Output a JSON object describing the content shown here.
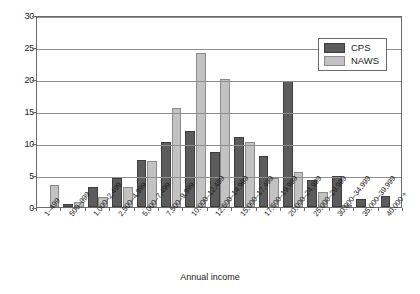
{
  "chart_data": {
    "type": "bar",
    "title": "",
    "xlabel": "Annual income",
    "ylabel": "",
    "ylim": [
      0,
      30
    ],
    "yticks": [
      0,
      5,
      10,
      15,
      20,
      25,
      30
    ],
    "grid": true,
    "legend_position": "top-right",
    "categories": [
      "1–499",
      "500–999",
      "1,000–2,499",
      "2,500–4,999",
      "5,000–7,499",
      "7,500–9,999",
      "10,000–12,499",
      "12,500–14,999",
      "15,000–17,499",
      "17,500–19,999",
      "20,000–24,999",
      "25,000–29,999",
      "30,000–34,999",
      "35,000–39,999",
      "40,000 +"
    ],
    "series": [
      {
        "name": "CPS",
        "color": "#5c5c5c",
        "values": [
          0,
          0.5,
          3.2,
          4.6,
          7.3,
          10.2,
          11.9,
          8.6,
          11.0,
          8.0,
          19.7,
          4.2,
          4.8,
          1.3,
          1.7
        ]
      },
      {
        "name": "NAWS",
        "color": "#c2c2c2",
        "values": [
          3.4,
          0.8,
          1.6,
          3.1,
          7.2,
          15.5,
          24.0,
          20.0,
          10.2,
          4.6,
          5.5,
          2.3,
          0.2,
          0,
          0
        ]
      }
    ]
  }
}
